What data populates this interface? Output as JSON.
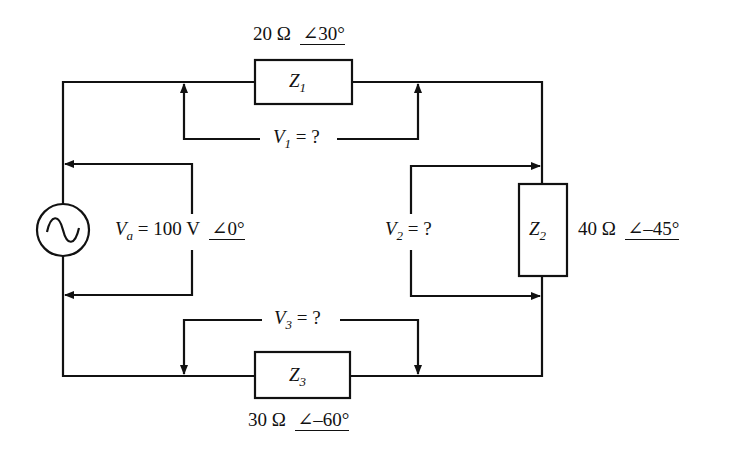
{
  "diagram": {
    "type": "ac-series-circuit",
    "source": {
      "symbol": "V",
      "subscript": "a",
      "equals": "=",
      "magnitude": "100 V",
      "angle_symbol": "∠",
      "angle": "0°",
      "icon": "ac-source-icon"
    },
    "impedances": [
      {
        "symbol": "Z",
        "subscript": "1",
        "magnitude": "20 Ω",
        "angle_symbol": "∠",
        "angle": "30°"
      },
      {
        "symbol": "Z",
        "subscript": "2",
        "magnitude": "40 Ω",
        "angle_symbol": "∠",
        "angle": "–45°"
      },
      {
        "symbol": "Z",
        "subscript": "3",
        "magnitude": "30 Ω",
        "angle_symbol": "∠",
        "angle": "–60°"
      }
    ],
    "voltages": [
      {
        "symbol": "V",
        "subscript": "1",
        "rest": " = ?"
      },
      {
        "symbol": "V",
        "subscript": "2",
        "rest": " = ?"
      },
      {
        "symbol": "V",
        "subscript": "3",
        "rest": " = ?"
      }
    ],
    "colors": {
      "line": "#111111",
      "background": "#ffffff"
    }
  }
}
